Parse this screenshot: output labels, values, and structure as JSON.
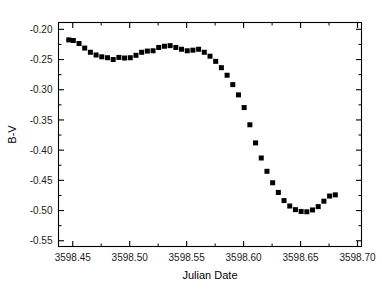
{
  "chart_data": {
    "type": "scatter",
    "title": "",
    "xlabel": "Julian Date",
    "ylabel": "B-V",
    "xlim": [
      3598.4375,
      3598.7035
    ],
    "ylim": [
      -0.1887,
      -0.5595
    ],
    "y_inverted": true,
    "grid": false,
    "legend": null,
    "marker": "square",
    "marker_color": "#000000",
    "marker_size_px": 5,
    "xticks": [
      3598.45,
      3598.5,
      3598.55,
      3598.6,
      3598.65,
      3598.7
    ],
    "xtick_labels": [
      "3598.45",
      "3598.50",
      "3598.55",
      "3598.60",
      "3598.65",
      "3598.70"
    ],
    "x_minor_ticks": [
      3598.425,
      3598.475,
      3598.525,
      3598.575,
      3598.625,
      3598.675
    ],
    "yticks": [
      -0.55,
      -0.5,
      -0.45,
      -0.4,
      -0.35,
      -0.3,
      -0.25,
      -0.2
    ],
    "ytick_labels": [
      "-0.55",
      "-0.50",
      "-0.45",
      "-0.40",
      "-0.35",
      "-0.30",
      "-0.25",
      "-0.20"
    ],
    "y_minor_ticks": [
      -0.525,
      -0.475,
      -0.425,
      -0.375,
      -0.325,
      -0.275,
      -0.225
    ],
    "x": [
      3598.4465,
      3598.4505,
      3598.4555,
      3598.4605,
      3598.4655,
      3598.4705,
      3598.4755,
      3598.4805,
      3598.4855,
      3598.4905,
      3598.4955,
      3598.5005,
      3598.5055,
      3598.5105,
      3598.5155,
      3598.5205,
      3598.5255,
      3598.5305,
      3598.5355,
      3598.5405,
      3598.5455,
      3598.5505,
      3598.5555,
      3598.5605,
      3598.5655,
      3598.5705,
      3598.5755,
      3598.5805,
      3598.5855,
      3598.5905,
      3598.5955,
      3598.6005,
      3598.6055,
      3598.6105,
      3598.6155,
      3598.6205,
      3598.6255,
      3598.6305,
      3598.6355,
      3598.6405,
      3598.6455,
      3598.6505,
      3598.6555,
      3598.6605,
      3598.6655,
      3598.6705,
      3598.6755,
      3598.6805
    ],
    "y": [
      -0.2175,
      -0.2185,
      -0.2235,
      -0.231,
      -0.238,
      -0.2425,
      -0.2455,
      -0.247,
      -0.25,
      -0.2465,
      -0.2475,
      -0.247,
      -0.243,
      -0.238,
      -0.236,
      -0.2355,
      -0.23,
      -0.228,
      -0.227,
      -0.23,
      -0.233,
      -0.2355,
      -0.2345,
      -0.233,
      -0.238,
      -0.2445,
      -0.253,
      -0.2635,
      -0.276,
      -0.2915,
      -0.3085,
      -0.3295,
      -0.358,
      -0.388,
      -0.413,
      -0.435,
      -0.454,
      -0.47,
      -0.4835,
      -0.4925,
      -0.4985,
      -0.5015,
      -0.502,
      -0.499,
      -0.4935,
      -0.4845,
      -0.476,
      -0.474
    ]
  },
  "axes": {
    "xlabel": "Julian Date",
    "ylabel": "B-V"
  }
}
